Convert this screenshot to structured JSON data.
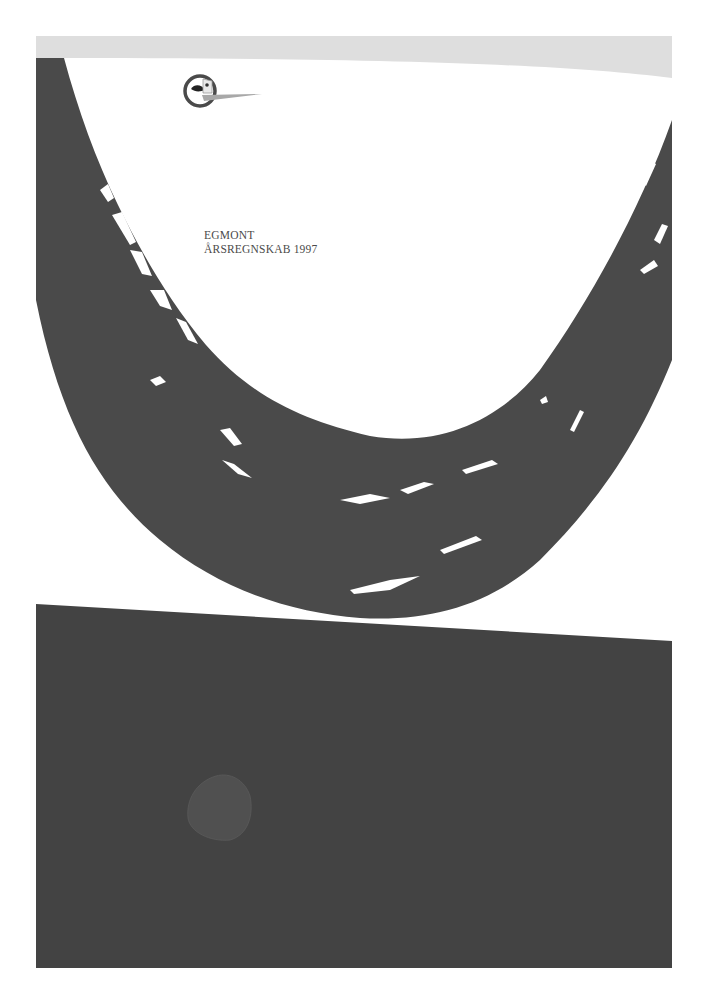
{
  "document": {
    "company": "EGMONT",
    "report_title": "ÅRSREGNSKAB 1997"
  },
  "logo": {
    "icon": "egmont-face-logo"
  },
  "colors": {
    "background": "#ffffff",
    "top_band": "#dedede",
    "brush_stroke": "#4a4a4a",
    "bottom_panel": "#434343",
    "bottom_shape": "#505050",
    "text": "#4a4a4a"
  }
}
